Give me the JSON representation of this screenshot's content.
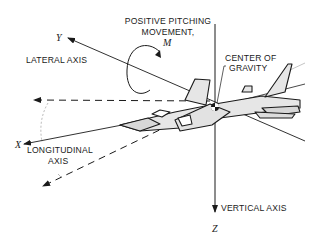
{
  "diagram": {
    "labels": {
      "pitching_line1": "POSITIVE PITCHING",
      "pitching_line2": "MOVEMENT,",
      "moment_symbol": "M",
      "lateral_axis": "LATERAL AXIS",
      "y_symbol": "Y",
      "cg_line1": "CENTER OF",
      "cg_line2": "GRAVITY",
      "x_symbol": "X",
      "longitudinal_line1": "LONGITUDINAL",
      "longitudinal_line2": "AXIS",
      "vertical_axis": "VERTICAL AXIS",
      "z_symbol": "Z"
    },
    "colors": {
      "ink": "#1a1a1a",
      "fill": "#e6e6e6",
      "background": "#ffffff"
    }
  }
}
